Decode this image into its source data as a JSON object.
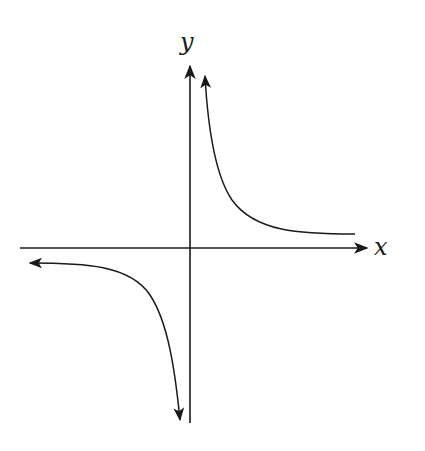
{
  "diagram": {
    "title": "",
    "axes": {
      "x_label": "x",
      "y_label": "y"
    },
    "curve": "hyperbola y = k/x (k > 0)",
    "branches": [
      {
        "name": "first-quadrant",
        "description": "asymptotic to positive y-axis and positive x-axis"
      },
      {
        "name": "third-quadrant",
        "description": "asymptotic to negative x-axis and negative y-axis"
      }
    ],
    "colors": {
      "stroke": "#1a1a1a",
      "background": "#ffffff"
    }
  }
}
